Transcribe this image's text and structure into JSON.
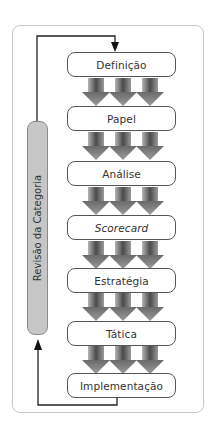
{
  "diagram": {
    "steps": [
      {
        "label": "Definição",
        "italic": false
      },
      {
        "label": "Papel",
        "italic": false
      },
      {
        "label": "Análise",
        "italic": false
      },
      {
        "label": "Scorecard",
        "italic": true
      },
      {
        "label": "Estratégia",
        "italic": false
      },
      {
        "label": "Tática",
        "italic": false
      },
      {
        "label": "Implementação",
        "italic": false
      }
    ],
    "feedback_label": "Revisão da Categoria",
    "colors": {
      "arrow_dark": "#555555",
      "arrow_light": "#a8a8a8",
      "pill_fill": "#c6c6c6",
      "line": "#222222"
    }
  }
}
